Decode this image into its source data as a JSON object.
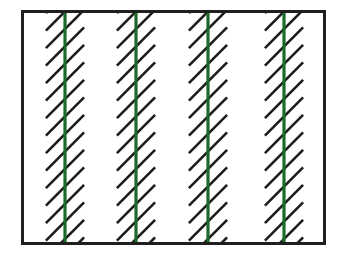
{
  "figure": {
    "canvas_width": 343,
    "canvas_height": 256,
    "background_color": "#ffffff"
  },
  "frame": {
    "name": "rectangular-border",
    "x": 21,
    "y": 10,
    "width": 305,
    "height": 235,
    "border_color": "#1f1f1f",
    "border_width": 3,
    "fill_color": "#ffffff"
  },
  "pattern": {
    "description": "Four vertical green lines, each flanked by a band of parallel black diagonal hatch marks at 45 degrees rising to the right, separated by white gaps.",
    "hatch": {
      "color": "#1c1c1c",
      "stroke_width": 2.6,
      "angle_degrees": 45,
      "direction": "bottom-left-to-top-right",
      "vertical_spacing": 17.5,
      "segment_length": 54,
      "band_half_width": 34,
      "count_per_band": 15
    },
    "green_lines": {
      "color": "#1a6b2a",
      "stroke_width": 3.2,
      "count": 4,
      "x_positions": [
        65,
        136,
        208,
        284
      ],
      "y_top": 10,
      "y_bottom": 245
    },
    "gaps": {
      "color": "#ffffff",
      "between_bands": 3
    }
  },
  "legend": {
    "green_label": "vertical line",
    "hatch_label": "diagonal hatching"
  }
}
